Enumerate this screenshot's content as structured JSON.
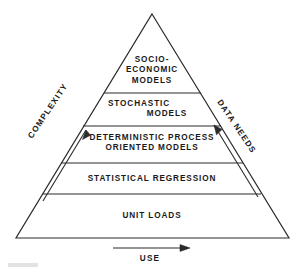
{
  "figure": {
    "type": "pyramid-diagram",
    "title": "",
    "line_color": "#2b2b2b",
    "text_color": "#1a1a1a",
    "background": "#ffffff"
  },
  "pyramid": {
    "tiers": [
      {
        "id": "tier-socio-economic-models",
        "level": 5,
        "lines": [
          "SOCIO-",
          "ECONOMIC",
          "MODELS"
        ],
        "alignment": "center"
      },
      {
        "id": "tier-stochastic-models",
        "level": 4,
        "lines": [
          "STOCHASTIC",
          "MODELS"
        ],
        "alignment": "staggered"
      },
      {
        "id": "tier-deterministic-process-oriented-models",
        "level": 3,
        "lines": [
          "DETERMINISTIC PROCESS",
          "ORIENTED MODELS"
        ],
        "alignment": "center"
      },
      {
        "id": "tier-statistical-regression",
        "level": 2,
        "lines": [
          "STATISTICAL  REGRESSION"
        ],
        "alignment": "center"
      },
      {
        "id": "tier-unit-loads",
        "level": 1,
        "lines": [
          "UNIT  LOADS"
        ],
        "alignment": "center"
      }
    ]
  },
  "axes": {
    "left": {
      "label": "COMPLEXITY",
      "direction": "increasing-upward",
      "arrow": "up-right-arrow-icon"
    },
    "right": {
      "label": "DATA NEEDS",
      "direction": "increasing-upward",
      "arrow": "up-left-arrow-icon"
    },
    "bottom": {
      "label": "USE",
      "direction": "increasing-rightward",
      "arrow": "right-arrow-icon"
    }
  }
}
